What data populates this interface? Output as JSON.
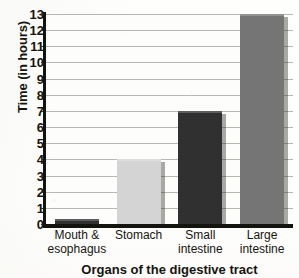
{
  "chart_data": {
    "type": "bar",
    "title": "",
    "categories": [
      "Mouth &\nesophagus",
      "Stomach",
      "Small\nintestine",
      "Large\nintestine"
    ],
    "values": [
      0.3,
      4,
      7,
      13
    ],
    "xlabel": "Organs of the digestive tract",
    "ylabel": "Time (in hours)",
    "ylim": [
      0,
      13
    ],
    "ytick_step": 1,
    "yticks": [
      "13",
      "12",
      "11",
      "10",
      "9",
      "8",
      "7",
      "6",
      "5",
      "4",
      "3",
      "2",
      "1",
      "0"
    ],
    "grid": "horizontal",
    "legend": "none",
    "bar_colors": [
      "#303030",
      "#d4d4d4",
      "#303030",
      "#757575"
    ],
    "axis_color": "#14140f",
    "gridline_color": "#b8b8b2",
    "background_color": "#fdfdfb"
  }
}
